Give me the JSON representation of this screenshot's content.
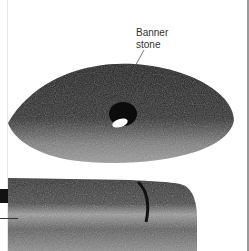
{
  "annotation": {
    "label_line1": "Banner",
    "label_line2": "stone"
  },
  "colors": {
    "background": "#ffffff",
    "stone_dark": "#1e1e1e",
    "stone_mid": "#6a6a6a",
    "stone_light": "#b8b8b8",
    "hole": "#ffffff"
  }
}
